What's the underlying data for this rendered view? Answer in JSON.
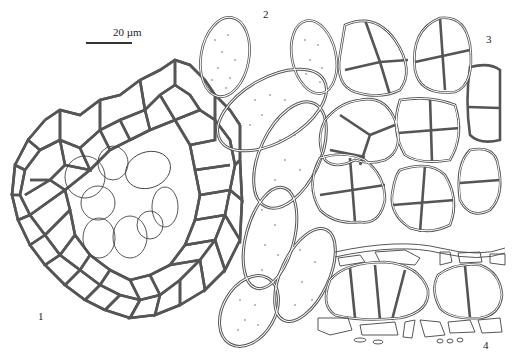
{
  "figure": {
    "scale_bar": {
      "label": "20 µm"
    },
    "panels": [
      {
        "id": "1",
        "label": "1",
        "content": "hexagonal reticulate network with overlapping circular cells"
      },
      {
        "id": "2",
        "label": "2",
        "content": "ellipsoid spores with punctate ornamentation"
      },
      {
        "id": "3",
        "label": "3",
        "content": "muriform multi-celled spore groups"
      },
      {
        "id": "4",
        "label": "4",
        "content": "cross-section of tissue with septate cells"
      }
    ]
  }
}
